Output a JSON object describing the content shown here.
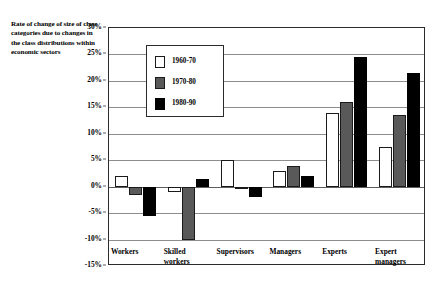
{
  "chart_data": {
    "type": "bar",
    "title": "Rate of change of size of class categories due to changes in the class distributions within economic sectors",
    "xlabel": "",
    "ylabel": "",
    "ylim": [
      -15,
      30
    ],
    "ytick_step": 5,
    "ytick_labels": [
      "30%",
      "25%",
      "20%",
      "15%",
      "10%",
      "5%",
      "0%",
      "-5%",
      "-10%",
      "-15%"
    ],
    "ytick_values": [
      30,
      25,
      20,
      15,
      10,
      5,
      0,
      -5,
      -10,
      -15
    ],
    "grid": true,
    "legend_position": "inside-upper-left",
    "categories": [
      "Workers",
      "Skilled workers",
      "Supervisors",
      "Managers",
      "Experts",
      "Expert managers"
    ],
    "category_labels": [
      "Workers",
      "Skilled\nworkers",
      "Supervisors",
      "Managers",
      "Experts",
      "Expert\nmanagers"
    ],
    "series": [
      {
        "name": "1960-70",
        "color": "#ffffff",
        "values": [
          2,
          -1,
          5,
          3,
          14,
          7.5
        ]
      },
      {
        "name": "1970-80",
        "color": "#595959",
        "values": [
          -1.5,
          -10,
          -0.5,
          4,
          16,
          13.5
        ]
      },
      {
        "name": "1980-90",
        "color": "#000000",
        "values": [
          -5.5,
          1.5,
          -2,
          2,
          24.5,
          21.5
        ]
      }
    ]
  },
  "legend": {
    "items": [
      {
        "label": "1960-70"
      },
      {
        "label": "1970-80"
      },
      {
        "label": "1980-90"
      }
    ]
  }
}
